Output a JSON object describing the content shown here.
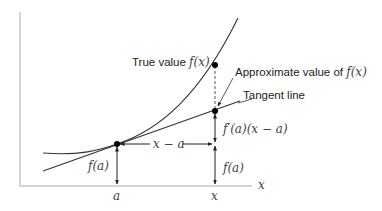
{
  "diagram": {
    "type": "linear approximation (tangent line) illustration",
    "labels": {
      "true_value_text": "True value ",
      "true_value_math": "f(x)",
      "approx_text": "Approximate value of ",
      "approx_math": "f(x)",
      "tangent_line": "Tangent line",
      "x_minus_a": "x − a",
      "f_a_left": "f(a)",
      "f_a_right": "f(a)",
      "fprime_term": "f′(a)(x − a)",
      "x_axis_label": "x",
      "tick_a": "a",
      "tick_x": "x"
    },
    "colors": {
      "curve": "#333333",
      "axes": "#999999",
      "points": "#000000",
      "text": "#222222"
    }
  }
}
